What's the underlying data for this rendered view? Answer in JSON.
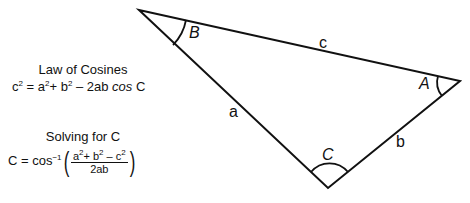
{
  "law_of_cosines": {
    "title": "Law of Cosines",
    "lhs": "c",
    "lhs_exp": "2",
    "eq": " = a",
    "a_exp": "2",
    "plus_b": "+ b",
    "b_exp": "2",
    "tail": " – 2ab ",
    "cos": "cos",
    "angle": " C"
  },
  "solving": {
    "title": "Solving for C",
    "lhs": "C = cos",
    "inv_exp": "−1",
    "num_a": "a",
    "num_a_exp": "2",
    "num_b": "+ b",
    "num_b_exp": "2",
    "num_c": " – c",
    "num_c_exp": "2",
    "den": "2ab",
    "paren_open": "(",
    "paren_close": ")"
  },
  "triangle": {
    "vertices": {
      "B": [
        139,
        10
      ],
      "A": [
        460,
        81
      ],
      "C": [
        328,
        188
      ]
    },
    "angle_labels": {
      "B": "B",
      "A": "A",
      "C": "C"
    },
    "side_labels": {
      "a": "a",
      "b": "b",
      "c": "c"
    },
    "stroke_color": "#111111"
  }
}
